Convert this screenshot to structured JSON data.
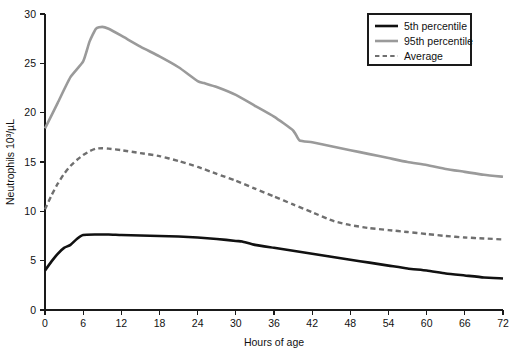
{
  "chart_data": {
    "type": "line",
    "title": "",
    "xlabel": "Hours of age",
    "ylabel": "Neutrophils 10³/µL",
    "xlim": [
      0,
      72
    ],
    "ylim": [
      0,
      30
    ],
    "xticks": [
      0,
      6,
      12,
      18,
      24,
      30,
      36,
      42,
      48,
      54,
      60,
      66,
      72
    ],
    "yticks": [
      0,
      5,
      10,
      15,
      20,
      25,
      30
    ],
    "xtick_labels": [
      "0",
      "6",
      "12",
      "18",
      "24",
      "30",
      "36",
      "42",
      "48",
      "54",
      "60",
      "66",
      "72"
    ],
    "ytick_labels": [
      "0",
      "5",
      "10",
      "15",
      "20",
      "25",
      "30"
    ],
    "grid": false,
    "legend_position": "top-right",
    "series": [
      {
        "name": "5th percentile",
        "style": "solid",
        "color": "#111111",
        "width": 2.6,
        "x": [
          0,
          1,
          2,
          3,
          4,
          5,
          6,
          8,
          10,
          12,
          15,
          18,
          21,
          24,
          27,
          30,
          31,
          33,
          36,
          39,
          42,
          45,
          48,
          51,
          54,
          57,
          60,
          63,
          66,
          69,
          72
        ],
        "y": [
          4.0,
          4.9,
          5.7,
          6.3,
          6.6,
          7.2,
          7.6,
          7.65,
          7.65,
          7.6,
          7.55,
          7.5,
          7.45,
          7.35,
          7.2,
          7.0,
          6.95,
          6.6,
          6.3,
          6.0,
          5.7,
          5.4,
          5.1,
          4.8,
          4.5,
          4.2,
          4.0,
          3.7,
          3.5,
          3.3,
          3.2
        ]
      },
      {
        "name": "95th percentile",
        "style": "solid",
        "color": "#9a9a9a",
        "width": 2.6,
        "x": [
          0,
          2,
          4,
          6,
          7,
          8,
          9,
          10,
          12,
          15,
          18,
          21,
          24,
          25,
          27,
          30,
          33,
          36,
          39,
          40,
          42,
          45,
          48,
          51,
          54,
          57,
          60,
          63,
          66,
          69,
          72
        ],
        "y": [
          18.4,
          21.0,
          23.6,
          25.2,
          27.2,
          28.5,
          28.7,
          28.5,
          27.8,
          26.7,
          25.7,
          24.6,
          23.2,
          23.0,
          22.6,
          21.8,
          20.7,
          19.6,
          18.2,
          17.2,
          17.0,
          16.6,
          16.2,
          15.8,
          15.4,
          15.0,
          14.7,
          14.3,
          14.0,
          13.7,
          13.5
        ]
      },
      {
        "name": "Average",
        "style": "dashed",
        "color": "#6f6f6f",
        "width": 2.4,
        "x": [
          0,
          1,
          2,
          3,
          4,
          5,
          6,
          7,
          8,
          9,
          10,
          12,
          15,
          18,
          21,
          24,
          27,
          30,
          33,
          36,
          39,
          42,
          45,
          46,
          48,
          51,
          54,
          57,
          60,
          63,
          66,
          69,
          72
        ],
        "y": [
          10.2,
          11.6,
          12.8,
          13.8,
          14.6,
          15.2,
          15.7,
          16.1,
          16.35,
          16.4,
          16.35,
          16.2,
          15.9,
          15.6,
          15.1,
          14.5,
          13.8,
          13.1,
          12.3,
          11.5,
          10.7,
          9.9,
          9.1,
          8.9,
          8.6,
          8.3,
          8.1,
          7.9,
          7.7,
          7.5,
          7.35,
          7.25,
          7.15
        ]
      }
    ]
  },
  "legend": {
    "items": [
      {
        "label": "5th percentile",
        "style": "solid",
        "color": "#111111"
      },
      {
        "label": "95th percentile",
        "style": "solid",
        "color": "#9a9a9a"
      },
      {
        "label": "Average",
        "style": "dashed",
        "color": "#6f6f6f"
      }
    ]
  }
}
